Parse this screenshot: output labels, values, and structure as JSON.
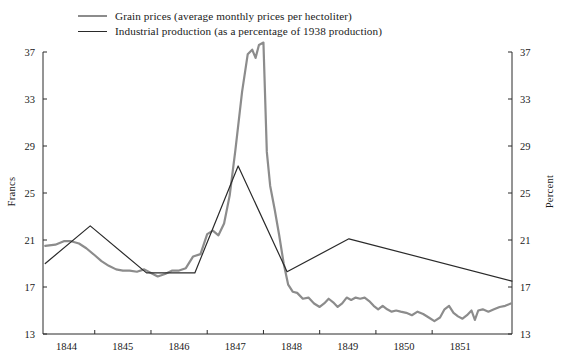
{
  "legend": {
    "items": [
      {
        "key": "grain",
        "label": "Grain prices (average monthly prices per hectoliter)",
        "color": "#8c8c8c"
      },
      {
        "key": "industrial",
        "label": "Industrial production (as a percentage of 1938 production)",
        "color": "#2a2a2a"
      }
    ]
  },
  "axes": {
    "left_title": "Francs",
    "right_title": "Percent",
    "y_ticks": [
      13,
      17,
      21,
      25,
      29,
      33,
      37
    ],
    "x_ticks": [
      "1844",
      "1845",
      "1846",
      "1847",
      "1848",
      "1849",
      "1850",
      "1851"
    ]
  },
  "chart_data": {
    "type": "line",
    "title": "",
    "xlabel": "",
    "ylabel": "Francs",
    "y2label": "Percent",
    "xlim": [
      1843.58,
      1851.92
    ],
    "ylim": [
      13,
      37
    ],
    "y_ticks": [
      13,
      17,
      21,
      25,
      29,
      33,
      37
    ],
    "x_tick_labels": [
      "1844",
      "1845",
      "1846",
      "1847",
      "1848",
      "1849",
      "1850",
      "1851"
    ],
    "x_tick_values": [
      1844,
      1845,
      1846,
      1847,
      1848,
      1849,
      1850,
      1851
    ],
    "grid": false,
    "legend_position": "top",
    "series": [
      {
        "name": "Grain prices (average monthly prices per hectoliter)",
        "unit": "Francs",
        "axis": "left",
        "color": "#8c8c8c",
        "points": [
          [
            1843.62,
            20.5
          ],
          [
            1843.8,
            20.6
          ],
          [
            1843.95,
            20.9
          ],
          [
            1844.08,
            20.9
          ],
          [
            1844.22,
            20.7
          ],
          [
            1844.35,
            20.3
          ],
          [
            1844.5,
            19.7
          ],
          [
            1844.62,
            19.2
          ],
          [
            1844.75,
            18.8
          ],
          [
            1844.88,
            18.5
          ],
          [
            1845.0,
            18.4
          ],
          [
            1845.12,
            18.4
          ],
          [
            1845.25,
            18.3
          ],
          [
            1845.38,
            18.5
          ],
          [
            1845.5,
            18.2
          ],
          [
            1845.62,
            17.9
          ],
          [
            1845.75,
            18.1
          ],
          [
            1845.88,
            18.4
          ],
          [
            1846.0,
            18.4
          ],
          [
            1846.12,
            18.6
          ],
          [
            1846.25,
            19.6
          ],
          [
            1846.38,
            19.8
          ],
          [
            1846.5,
            21.5
          ],
          [
            1846.6,
            21.8
          ],
          [
            1846.7,
            21.4
          ],
          [
            1846.8,
            22.4
          ],
          [
            1846.9,
            24.8
          ],
          [
            1847.0,
            28.6
          ],
          [
            1847.12,
            33.6
          ],
          [
            1847.22,
            36.8
          ],
          [
            1847.3,
            37.2
          ],
          [
            1847.36,
            36.5
          ],
          [
            1847.42,
            37.6
          ],
          [
            1847.5,
            37.8
          ],
          [
            1847.56,
            28.5
          ],
          [
            1847.62,
            25.6
          ],
          [
            1847.7,
            23.6
          ],
          [
            1847.78,
            21.4
          ],
          [
            1847.86,
            19.0
          ],
          [
            1847.94,
            17.2
          ],
          [
            1848.02,
            16.6
          ],
          [
            1848.1,
            16.5
          ],
          [
            1848.2,
            16.0
          ],
          [
            1848.3,
            16.1
          ],
          [
            1848.4,
            15.6
          ],
          [
            1848.5,
            15.3
          ],
          [
            1848.58,
            15.6
          ],
          [
            1848.66,
            16.0
          ],
          [
            1848.74,
            15.7
          ],
          [
            1848.82,
            15.3
          ],
          [
            1848.9,
            15.6
          ],
          [
            1848.98,
            16.1
          ],
          [
            1849.06,
            15.9
          ],
          [
            1849.14,
            16.1
          ],
          [
            1849.22,
            16.0
          ],
          [
            1849.3,
            16.1
          ],
          [
            1849.38,
            15.8
          ],
          [
            1849.46,
            15.4
          ],
          [
            1849.54,
            15.1
          ],
          [
            1849.62,
            15.4
          ],
          [
            1849.7,
            15.1
          ],
          [
            1849.78,
            14.9
          ],
          [
            1849.86,
            15.0
          ],
          [
            1849.94,
            14.9
          ],
          [
            1850.04,
            14.8
          ],
          [
            1850.14,
            14.6
          ],
          [
            1850.24,
            14.9
          ],
          [
            1850.34,
            14.7
          ],
          [
            1850.44,
            14.4
          ],
          [
            1850.54,
            14.1
          ],
          [
            1850.64,
            14.4
          ],
          [
            1850.72,
            15.1
          ],
          [
            1850.8,
            15.4
          ],
          [
            1850.88,
            14.8
          ],
          [
            1850.96,
            14.5
          ],
          [
            1851.04,
            14.3
          ],
          [
            1851.12,
            14.6
          ],
          [
            1851.2,
            15.0
          ],
          [
            1851.26,
            14.2
          ],
          [
            1851.32,
            15.0
          ],
          [
            1851.4,
            15.1
          ],
          [
            1851.5,
            14.9
          ],
          [
            1851.6,
            15.1
          ],
          [
            1851.7,
            15.3
          ],
          [
            1851.8,
            15.4
          ],
          [
            1851.9,
            15.6
          ]
        ]
      },
      {
        "name": "Industrial production (as a percentage of 1938 production)",
        "unit": "Percent",
        "axis": "right",
        "color": "#2a2a2a",
        "points": [
          [
            1843.62,
            19.0
          ],
          [
            1844.42,
            22.2
          ],
          [
            1845.42,
            18.2
          ],
          [
            1846.28,
            18.2
          ],
          [
            1847.05,
            27.3
          ],
          [
            1847.92,
            18.3
          ],
          [
            1849.02,
            21.1
          ],
          [
            1851.92,
            17.5
          ]
        ]
      }
    ]
  }
}
